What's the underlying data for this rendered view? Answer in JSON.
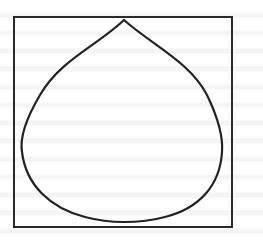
{
  "figure": {
    "frame": {
      "x": 14,
      "y": 17,
      "width": 218,
      "height": 210
    },
    "drop": {
      "apex": [
        124,
        20
      ],
      "left_extreme": [
        22,
        145
      ],
      "right_extreme": [
        222,
        145
      ],
      "bottom": [
        124,
        222
      ]
    },
    "stroke_color": "#222222",
    "background_color": "#ffffff"
  }
}
